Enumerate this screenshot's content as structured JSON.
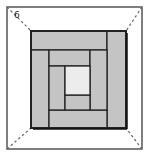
{
  "diagram": {
    "type": "quilt-block",
    "name": "Log Cabin block in frame",
    "label": "6",
    "colors": {
      "frame_line": "#555555",
      "diagonal": "#666666",
      "strip_fill": "#c4c4c4",
      "center_fill": "#ececec",
      "block_border": "#222222",
      "background": "#ffffff"
    },
    "frame": {
      "x": 7,
      "y": 7,
      "w": 135,
      "h": 142
    },
    "block": {
      "x": 31,
      "y": 31,
      "w": 95,
      "h": 97
    },
    "pieces": [
      {
        "id": "top-strip-outer",
        "x": 31,
        "y": 31,
        "w": 76,
        "h": 19,
        "fill": "strip"
      },
      {
        "id": "right-strip-outer",
        "x": 107,
        "y": 31,
        "w": 19,
        "h": 97,
        "fill": "strip"
      },
      {
        "id": "left-strip-outer",
        "x": 31,
        "y": 50,
        "w": 18,
        "h": 78,
        "fill": "strip"
      },
      {
        "id": "bottom-strip-outer",
        "x": 49,
        "y": 110,
        "w": 58,
        "h": 18,
        "fill": "strip"
      },
      {
        "id": "top-strip-inner",
        "x": 49,
        "y": 50,
        "w": 41,
        "h": 16,
        "fill": "strip"
      },
      {
        "id": "right-strip-inner",
        "x": 90,
        "y": 50,
        "w": 17,
        "h": 60,
        "fill": "strip"
      },
      {
        "id": "left-strip-inner",
        "x": 49,
        "y": 66,
        "w": 16,
        "h": 44,
        "fill": "strip"
      },
      {
        "id": "bottom-strip-inner",
        "x": 65,
        "y": 95,
        "w": 25,
        "h": 15,
        "fill": "strip"
      },
      {
        "id": "center-square",
        "x": 65,
        "y": 66,
        "w": 25,
        "h": 29,
        "fill": "center"
      }
    ],
    "diagonals": [
      {
        "id": "diag-top-left",
        "x1": 7,
        "y1": 7,
        "x2": 31,
        "y2": 31
      },
      {
        "id": "diag-top-right",
        "x1": 142,
        "y1": 7,
        "x2": 126,
        "y2": 31
      },
      {
        "id": "diag-bottom-left",
        "x1": 7,
        "y1": 149,
        "x2": 31,
        "y2": 128
      },
      {
        "id": "diag-bottom-right",
        "x1": 142,
        "y1": 149,
        "x2": 126,
        "y2": 128
      }
    ]
  }
}
